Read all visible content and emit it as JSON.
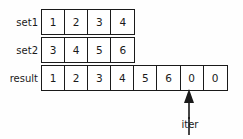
{
  "diagram": {
    "rows": [
      {
        "label": "set1",
        "values": [
          "1",
          "2",
          "3",
          "4"
        ]
      },
      {
        "label": "set2",
        "values": [
          "3",
          "4",
          "5",
          "6"
        ]
      },
      {
        "label": "result",
        "values": [
          "1",
          "2",
          "3",
          "4",
          "5",
          "6",
          "0",
          "0"
        ]
      }
    ],
    "pointer": {
      "label": "iter",
      "icon": "up-arrow-icon",
      "points_to_row": "result",
      "points_after_index": 6
    },
    "colors": {
      "line": "#1a1a1a",
      "text": "#1a1a1a",
      "cell_fill": "#ffffff",
      "background": "#fefefe"
    }
  }
}
